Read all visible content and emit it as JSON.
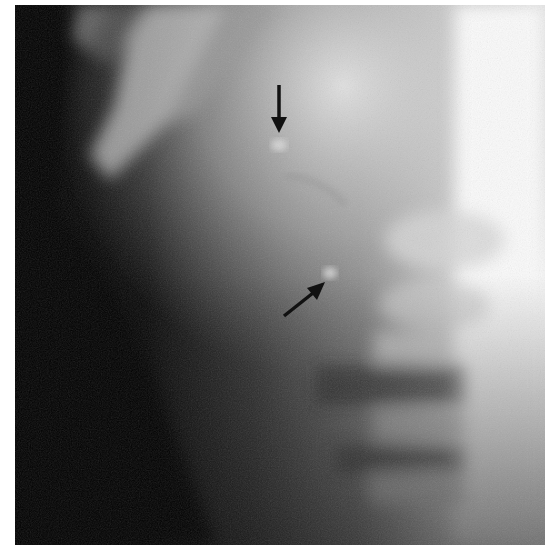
{
  "image": {
    "kind": "radiograph",
    "description": "Grayscale X-ray with dark left field, bright vertebral column on right, diagonal bright rib/clavicle bands at top-left, and two black annotation arrows marking small bright densities",
    "colors": {
      "background": "#ffffff",
      "dark_field": "#050505",
      "bright_bone": "#f4f4f4",
      "arrow": "#111111"
    }
  },
  "annotations": [
    {
      "id": "arrow-1",
      "direction": "down",
      "tip": [
        279,
        133
      ],
      "tail": [
        279,
        85
      ]
    },
    {
      "id": "arrow-2",
      "direction": "up-right",
      "tip": [
        325,
        282
      ],
      "tail": [
        284,
        315
      ]
    }
  ]
}
